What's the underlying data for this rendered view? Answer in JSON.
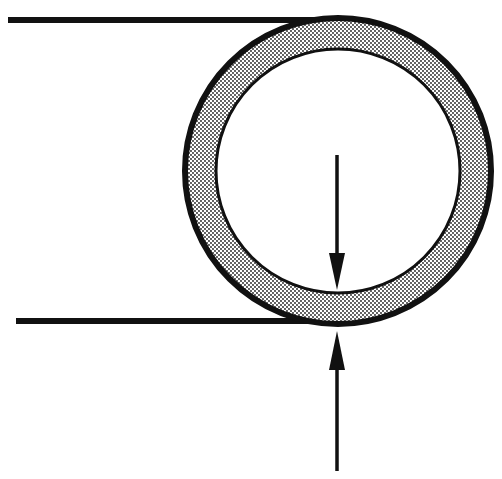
{
  "diagram": {
    "title": "",
    "colors": {
      "stroke": "#111111",
      "wall_fill": "#c8c8c8",
      "dot": "#1a1a1a",
      "background": "#ffffff"
    },
    "elements": [
      {
        "id": "top-line",
        "type": "tangent-line"
      },
      {
        "id": "bottom-line",
        "type": "tangent-line"
      },
      {
        "id": "tube-wall",
        "type": "annular-ring",
        "pattern": "dot-screen"
      },
      {
        "id": "arrow-down",
        "type": "dimension-arrow",
        "direction": "down"
      },
      {
        "id": "arrow-up",
        "type": "dimension-arrow",
        "direction": "up"
      }
    ]
  }
}
